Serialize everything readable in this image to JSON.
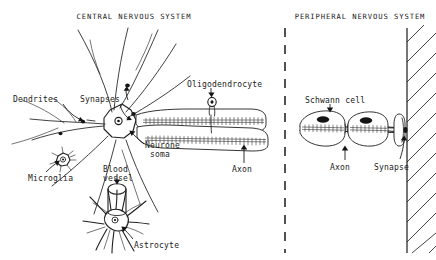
{
  "figure": {
    "background_color": "#ffffff",
    "ink_color": "#1a1a1a",
    "width": 436,
    "height": 260
  },
  "headings": {
    "cns": "CENTRAL NERVOUS SYSTEM",
    "pns": "PERIPHERAL NERVOUS SYSTEM"
  },
  "cns_labels": {
    "dendrites": "Dendrites",
    "synapses": "Synapses",
    "oligodendrocyte": "Oligodendrocyte",
    "neurone_soma_line1": "Neurone",
    "neurone_soma_line2": "soma",
    "axon": "Axon",
    "microglia": "Microglia",
    "blood_vessel_line1": "Blood",
    "blood_vessel_line2": "vessel",
    "astrocyte": "Astrocyte"
  },
  "pns_labels": {
    "schwann_cell": "Schwann cell",
    "axon": "Axon",
    "synapse": "Synapse"
  },
  "divider": {
    "style": "dashed-vertical",
    "x": 285
  },
  "muscle": {
    "style": "hatched-boundary",
    "x": 407
  }
}
